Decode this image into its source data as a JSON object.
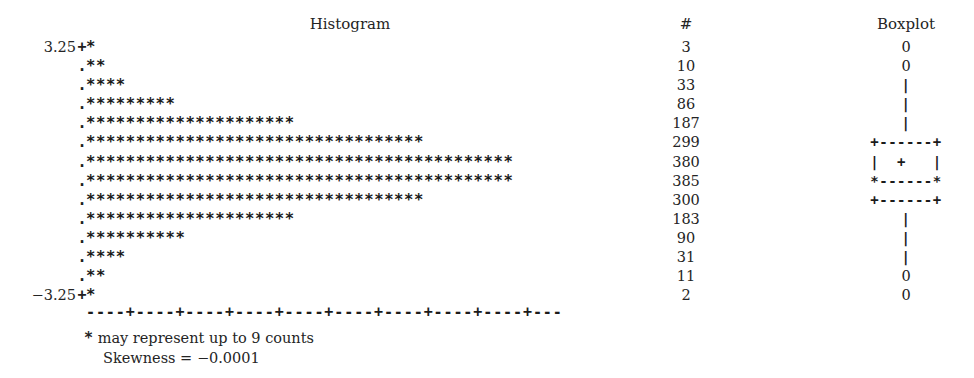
{
  "headers": {
    "histogram": "Histogram",
    "count": "#",
    "boxplot": "Boxplot"
  },
  "axis": {
    "top_label": "3.25",
    "bottom_label": "−3.25",
    "tick_plus": "+",
    "tick_dot": ".",
    "baseline": "----+----+----+----+----+----+----+----+----+---"
  },
  "footnotes": {
    "legend_glyph": "*",
    "legend_text": " may represent up to 9 counts",
    "skewness": "Skewness = −0.0001"
  },
  "rows": [
    {
      "axlabel": "3.25",
      "stem": "+",
      "stars": "*",
      "count": "3",
      "box": "0"
    },
    {
      "axlabel": "",
      "stem": ".",
      "stars": "**",
      "count": "10",
      "box": "0"
    },
    {
      "axlabel": "",
      "stem": ".",
      "stars": "****",
      "count": "33",
      "box": "|"
    },
    {
      "axlabel": "",
      "stem": ".",
      "stars": "*********",
      "count": "86",
      "box": "|"
    },
    {
      "axlabel": "",
      "stem": ".",
      "stars": "*********************",
      "count": "187",
      "box": "|"
    },
    {
      "axlabel": "",
      "stem": ".",
      "stars": "**********************************",
      "count": "299",
      "box": "+------+"
    },
    {
      "axlabel": "",
      "stem": ".",
      "stars": "*******************************************",
      "count": "380",
      "box": "|  +   |"
    },
    {
      "axlabel": "",
      "stem": ".",
      "stars": "*******************************************",
      "count": "385",
      "box": "*------*"
    },
    {
      "axlabel": "",
      "stem": ".",
      "stars": "**********************************",
      "count": "300",
      "box": "+------+"
    },
    {
      "axlabel": "",
      "stem": ".",
      "stars": "*********************",
      "count": "183",
      "box": "|"
    },
    {
      "axlabel": "",
      "stem": ".",
      "stars": "**********",
      "count": "90",
      "box": "|"
    },
    {
      "axlabel": "",
      "stem": ".",
      "stars": "****",
      "count": "31",
      "box": "|"
    },
    {
      "axlabel": "",
      "stem": ".",
      "stars": "**",
      "count": "11",
      "box": "0"
    },
    {
      "axlabel": "−3.25",
      "stem": "+",
      "stars": "*",
      "count": "2",
      "box": "0"
    }
  ],
  "chart_data": {
    "type": "bar",
    "title": "Histogram",
    "xlabel": "",
    "ylabel": "",
    "orientation": "horizontal",
    "grid": false,
    "legend": "none",
    "star_unit": 9,
    "axis_range": [
      -3.25,
      3.25
    ],
    "categories": [
      "3.25",
      "",
      "",
      "",
      "",
      "",
      "",
      "",
      "",
      "",
      "",
      "",
      "",
      "-3.25"
    ],
    "values": [
      3,
      10,
      33,
      86,
      187,
      299,
      380,
      385,
      300,
      183,
      90,
      31,
      11,
      2
    ],
    "star_counts": [
      1,
      2,
      4,
      9,
      21,
      34,
      43,
      43,
      34,
      21,
      10,
      4,
      2,
      1
    ],
    "annotations": [
      "* may represent up to 9 counts",
      "Skewness = -0.0001"
    ],
    "boxplot": {
      "outlier_rows": [
        0,
        1,
        12,
        13
      ],
      "whisker_rows": [
        2,
        3,
        4,
        9,
        10,
        11
      ],
      "box_top_row": 5,
      "box_mean_row": 6,
      "box_median_row": 7,
      "box_bottom_row": 8
    }
  }
}
